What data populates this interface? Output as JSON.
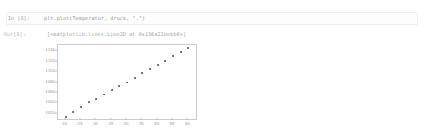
{
  "notebook": {
    "input_prompt": "In [8]:",
    "code": "plt.plot(Temperatur, druck, \".\")",
    "output_prompt": "Out[8]:",
    "output_text": "[<matplotlib.lines.Line2D at 0x196a22bebb0>]"
  },
  "colors": {
    "background": "#ffffff",
    "cell_border": "#eceef1",
    "prompt_text": "#9aa3ad",
    "code_text": "#8a9199",
    "marker": "#4a4a52",
    "axis": "#c9ccd1",
    "tick_text": "#9d9da5"
  },
  "chart_data": {
    "type": "scatter",
    "title": "",
    "xlabel": "",
    "ylabel": "",
    "xlim": [
      17.5,
      62.5
    ],
    "ylim": [
      1010,
      1152
    ],
    "grid": false,
    "legend": false,
    "marker": ".",
    "xticks": [
      20,
      25,
      30,
      35,
      40,
      45,
      50,
      55,
      60
    ],
    "yticks": [
      1020,
      1040,
      1060,
      1080,
      1100,
      1120,
      1140
    ],
    "xtick_labels": [
      "20",
      "25",
      "30",
      "35",
      "40",
      "45",
      "50",
      "55",
      "60"
    ],
    "ytick_labels": [
      "1020",
      "1040",
      "1060",
      "1080",
      "1100",
      "1120",
      "1140"
    ],
    "series": [
      {
        "name": "druck vs Temperatur",
        "x": [
          20,
          22.5,
          25,
          27.5,
          30,
          32.5,
          35,
          37.5,
          40,
          42.5,
          45,
          47.5,
          50,
          52.5,
          55,
          57.5,
          60
        ],
        "y": [
          1014,
          1023,
          1033,
          1042,
          1049,
          1057,
          1065,
          1073,
          1080,
          1089,
          1098,
          1106,
          1114,
          1122,
          1130,
          1139,
          1146
        ]
      }
    ]
  }
}
